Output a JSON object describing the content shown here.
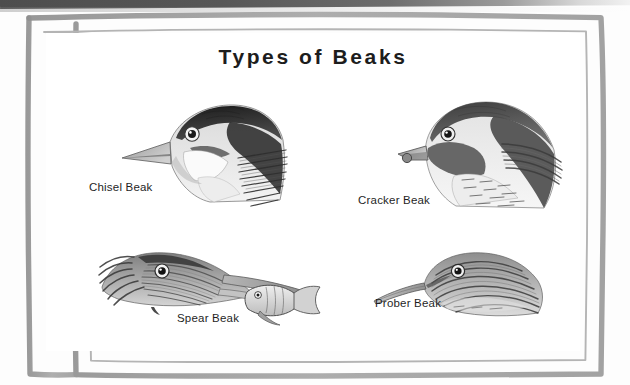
{
  "document": {
    "title": "Types of Beaks",
    "media": "scanned-worksheet-page",
    "background_color": "#ffffff",
    "ink_color": "#1d1d1d",
    "frame_color": "#a0a0a0",
    "scan_band_color": "#4d4d4d"
  },
  "border": {
    "style": "hand-drawn-double-rule",
    "outer_label": "outer-rule",
    "inner_label": "inner-rule"
  },
  "figures": [
    {
      "id": "chisel",
      "caption": "Chisel Beak",
      "icon": "woodpecker-head-illustration",
      "facing": "left",
      "beak_shape": "long straight chisel",
      "position": "top-left"
    },
    {
      "id": "cracker",
      "caption": "Cracker Beak",
      "icon": "grosbeak-head-illustration",
      "facing": "left",
      "beak_shape": "thick conical seed-cracking",
      "position": "top-right"
    },
    {
      "id": "spear",
      "caption": "Spear Beak",
      "icon": "heron-head-with-fish-illustration",
      "facing": "right",
      "beak_shape": "long dagger spear holding fish",
      "position": "bottom-left"
    },
    {
      "id": "prober",
      "caption": "Prober Beak",
      "icon": "shorebird-head-illustration",
      "facing": "left",
      "beak_shape": "long slender probing",
      "position": "bottom-right"
    }
  ]
}
